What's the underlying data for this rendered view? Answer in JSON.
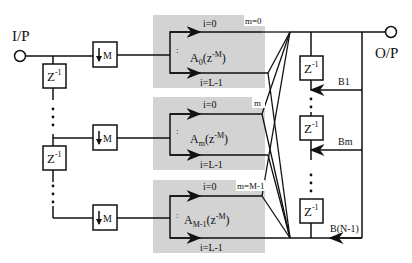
{
  "diagram": {
    "input_label": "I/P",
    "output_label": "O/P",
    "delay_label": "Z",
    "delay_exp": "-1",
    "decimator_label": "M",
    "colors": {
      "line": "#111111",
      "block_fill": "#d3d3d3",
      "background": "#ffffff"
    },
    "filters": [
      {
        "top_path": "i=0",
        "bottom_path": "i=L-1",
        "branch": "m=0",
        "name": "A",
        "sub": "0",
        "arg": "(z",
        "arg_exp": "-M",
        "close": ")"
      },
      {
        "top_path": "i=0",
        "bottom_path": "i=L-1",
        "branch": "m",
        "name": "A",
        "sub": "m",
        "arg": "(z",
        "arg_exp": "-M",
        "close": ")"
      },
      {
        "top_path": "i=0",
        "bottom_path": "i=L-1",
        "branch": "m=M-1",
        "name": "A",
        "sub": "M-1",
        "arg": "(z",
        "arg_exp": "-M",
        "close": ")"
      }
    ],
    "feedback_coeffs": [
      "B1",
      "Bm",
      "B(N-1)"
    ],
    "vertical_dots": ":"
  }
}
